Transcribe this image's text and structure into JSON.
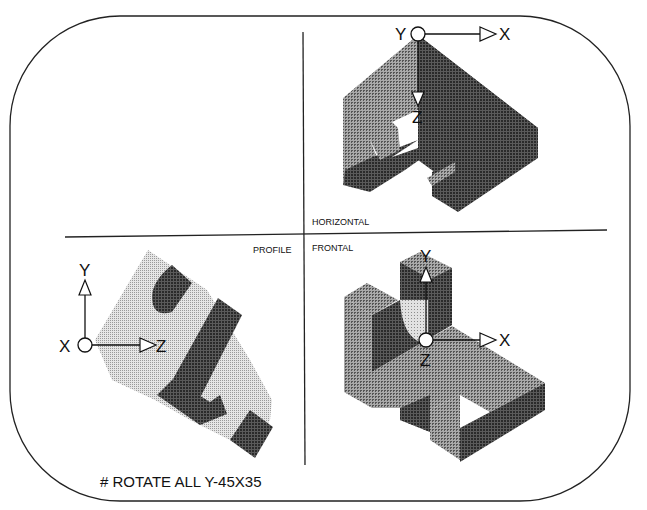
{
  "diagram": {
    "command": "# ROTATE ALL Y-45X35",
    "views": {
      "horizontal": {
        "label": "HORIZONTAL",
        "axes": {
          "horizontal": "X",
          "vertical": "Z",
          "depth": "Y"
        }
      },
      "profile": {
        "label": "PROFILE",
        "axes": {
          "horizontal": "Z",
          "vertical": "Y",
          "depth": "X"
        }
      },
      "frontal": {
        "label": "FRONTAL",
        "axes": {
          "horizontal": "X",
          "vertical": "Y",
          "depth": "Z"
        }
      }
    },
    "colors": {
      "frame": "#222222",
      "light": "#c8c8c8",
      "mid": "#8a8a8a",
      "dark": "#3e3e3e"
    }
  }
}
